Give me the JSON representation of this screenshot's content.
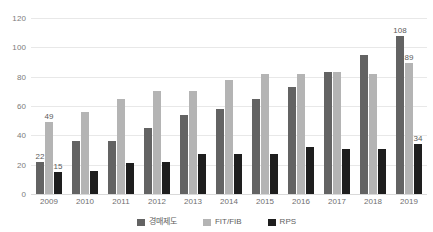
{
  "chart_data": {
    "type": "bar",
    "title": "",
    "subtitle": "",
    "xlabel": "",
    "ylabel": "",
    "ylim": [
      0,
      120
    ],
    "ytick_labels": [
      "120",
      "100",
      "80",
      "60",
      "40",
      "20",
      "0"
    ],
    "yticks": [
      120,
      100,
      80,
      60,
      40,
      20,
      0
    ],
    "grid": true,
    "legend_position": "bottom",
    "categories": [
      "2009",
      "2010",
      "2011",
      "2012",
      "2013",
      "2014",
      "2015",
      "2016",
      "2017",
      "2018",
      "2019"
    ],
    "series": [
      {
        "name": "경매제도",
        "color": "#636363",
        "values": [
          22,
          36,
          36,
          45,
          54,
          58,
          65,
          73,
          83,
          95,
          108
        ],
        "labels": [
          "22",
          "",
          "",
          "",
          "",
          "",
          "",
          "",
          "",
          "",
          "108"
        ]
      },
      {
        "name": "FIT/FIB",
        "color": "#b4b4b4",
        "values": [
          49,
          56,
          65,
          70,
          70,
          78,
          82,
          82,
          83,
          82,
          89
        ],
        "labels": [
          "49",
          "",
          "",
          "",
          "",
          "",
          "",
          "",
          "",
          "",
          "89"
        ]
      },
      {
        "name": "RPS",
        "color": "#1e1e1e",
        "values": [
          15,
          16,
          21,
          22,
          27,
          27,
          27,
          32,
          31,
          31,
          34
        ],
        "labels": [
          "15",
          "",
          "",
          "",
          "",
          "",
          "",
          "",
          "",
          "",
          "34"
        ]
      }
    ]
  }
}
